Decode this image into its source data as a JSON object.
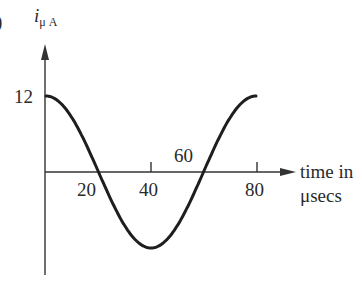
{
  "figure": {
    "panel_marker": ")",
    "y_axis_label_main": "i",
    "y_axis_label_sub": "μ A",
    "x_axis_label_line1": "time in",
    "x_axis_label_line2": "μsecs",
    "y_tick_label": "12",
    "x_tick_labels": [
      "20",
      "40",
      "60",
      "80"
    ]
  },
  "chart_data": {
    "type": "line",
    "title": "",
    "xlabel": "time in μsecs",
    "ylabel": "i μA",
    "x_ticks": [
      20,
      40,
      60,
      80
    ],
    "y_ticks": [
      12
    ],
    "xlim": [
      0,
      85
    ],
    "ylim": [
      -14,
      15
    ],
    "grid": false,
    "legend": null,
    "series": [
      {
        "name": "i(t) = 12 cos(2πt/80)",
        "x": [
          0,
          10,
          20,
          30,
          40,
          50,
          60,
          70,
          80
        ],
        "y": [
          12,
          8.49,
          0,
          -8.49,
          -12,
          -8.49,
          0,
          8.49,
          12
        ]
      }
    ],
    "annotations": [
      "curve is a cosine with amplitude 12 μA and period 80 μs"
    ]
  }
}
